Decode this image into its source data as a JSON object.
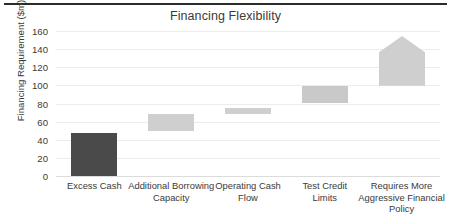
{
  "chart_data": {
    "type": "bar",
    "title": "Financing Flexibility",
    "xlabel": "",
    "ylabel": "Financing Requirement ($m)",
    "ylim": [
      0,
      160
    ],
    "yticks": [
      0,
      20,
      40,
      60,
      80,
      100,
      120,
      140,
      160
    ],
    "ytick_labels": [
      "0",
      "20",
      "40",
      "60",
      "80",
      "100",
      "120",
      "140",
      "160"
    ],
    "grid": true,
    "legend": "none",
    "style": "waterfall",
    "categories": [
      "Excess Cash",
      "Additional Borrowing Capacity",
      "Operating Cash Flow",
      "Test Credit Limits",
      "Requires More Aggressive Financial Policy"
    ],
    "bars": [
      {
        "label": "Excess Cash",
        "label_lines": [
          "Excess Cash"
        ],
        "bottom": 0,
        "top": 48,
        "value": 48,
        "color": "#4a4a4a",
        "shape": "rect"
      },
      {
        "label": "Additional Borrowing Capacity",
        "label_lines": [
          "Additional Borrowing",
          "Capacity"
        ],
        "bottom": 50,
        "top": 68,
        "value": 18,
        "color": "#cfcfcf",
        "shape": "rect"
      },
      {
        "label": "Operating Cash Flow",
        "label_lines": [
          "Operating Cash",
          "Flow"
        ],
        "bottom": 68,
        "top": 75,
        "value": 7,
        "color": "#cfcfcf",
        "shape": "rect"
      },
      {
        "label": "Test Credit Limits",
        "label_lines": [
          "Test Credit",
          "Limits"
        ],
        "bottom": 81,
        "top": 99,
        "value": 18,
        "color": "#c9c9c9",
        "shape": "rect"
      },
      {
        "label": "Requires More Aggressive Financial Policy",
        "label_lines": [
          "Requires More",
          "Aggressive Financial",
          "Policy"
        ],
        "bottom": 100,
        "top": 137,
        "apex": 155,
        "value": 37,
        "color": "#cfcfcf",
        "shape": "arrow-up"
      }
    ]
  },
  "colors": {
    "dark_bar": "#4a4a4a",
    "light_bar": "#cfcfcf",
    "gridline": "#ececec",
    "text": "#3a3a3a",
    "top_rule": "#2b2b2b"
  }
}
